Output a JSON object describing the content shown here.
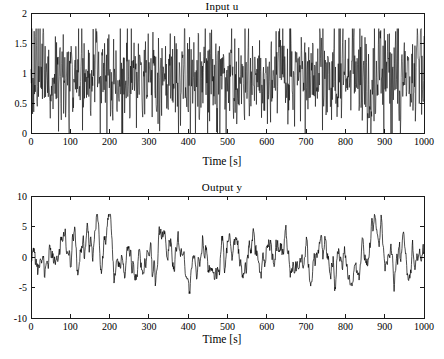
{
  "figure": {
    "background": "#ffffff",
    "foreground": "#000000"
  },
  "chart_data": [
    {
      "type": "line",
      "name": "input-u",
      "title": "Input u",
      "xlabel": "Time [s]",
      "ylabel": "",
      "xlim": [
        0,
        1000
      ],
      "ylim": [
        0,
        2
      ],
      "grid": false,
      "legend": null,
      "xticks": [
        0,
        100,
        200,
        300,
        400,
        500,
        600,
        700,
        800,
        900,
        1000
      ],
      "xticklabels": [
        "0",
        "100",
        "200",
        "300",
        "400",
        "500",
        "600",
        "700",
        "800",
        "900",
        "1000"
      ],
      "yticks": [
        0,
        0.5,
        1,
        1.5,
        2
      ],
      "yticklabels": [
        "0",
        "0.5",
        "1",
        "1.5",
        "2"
      ],
      "series": [
        {
          "name": "u",
          "color": "#000000",
          "description": "Dense high-frequency pseudo-random binary-like excitation signal, mean near 0.95, oscillating rapidly between about 0.0 and 1.7 over the full 0-1000 s record.",
          "stats": {
            "min": 0.0,
            "max": 1.72,
            "mean": 0.95
          },
          "n_points": 1000,
          "seed": 20117,
          "generator": "prbs_noise",
          "params": {
            "center": 0.95,
            "amplitude": 0.62,
            "spike": 0.28
          }
        }
      ]
    },
    {
      "type": "line",
      "name": "output-y",
      "title": "Output y",
      "xlabel": "Time [s]",
      "ylabel": "",
      "xlim": [
        0,
        1000
      ],
      "ylim": [
        -10,
        10
      ],
      "grid": false,
      "legend": null,
      "xticks": [
        0,
        100,
        200,
        300,
        400,
        500,
        600,
        700,
        800,
        900,
        1000
      ],
      "xticklabels": [
        "0",
        "100",
        "200",
        "300",
        "400",
        "500",
        "600",
        "700",
        "800",
        "900",
        "1000"
      ],
      "yticks": [
        -10,
        -5,
        0,
        5,
        10
      ],
      "yticklabels": [
        "-10",
        "-5",
        "0",
        "5",
        "10"
      ],
      "series": [
        {
          "name": "y",
          "color": "#000000",
          "description": "Low-pass filtered response of the plant to input u; smooth wandering oscillation with mean near 0, excursions mostly between -5.5 and +6.5.",
          "stats": {
            "min": -5.6,
            "max": 6.5,
            "mean": 0.0
          },
          "n_points": 1000,
          "seed": 7739,
          "generator": "filtered_noise",
          "params": {
            "smooth": 0.86,
            "scale": 3.1,
            "ripple": 0.55
          }
        }
      ]
    }
  ]
}
